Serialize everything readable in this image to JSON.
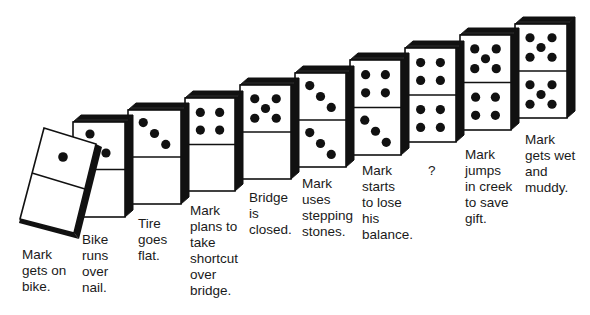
{
  "diagram": {
    "type": "domino-chain",
    "ink_color": "#111111",
    "face_color": "#ffffff",
    "dominoes": [
      {
        "index": 1,
        "top_pips": 1,
        "bottom_pips": 0,
        "fallen": true,
        "label": "Mark\ngets on\nbike.",
        "label_x": 22,
        "label_y": 247
      },
      {
        "index": 2,
        "top_pips": 2,
        "bottom_pips": 0,
        "x": 73,
        "y": 122,
        "w": 52,
        "h": 95,
        "label": "Bike\nruns\nover\nnail.",
        "label_x": 82,
        "label_y": 232
      },
      {
        "index": 3,
        "top_pips": 3,
        "bottom_pips": 0,
        "x": 128,
        "y": 110,
        "w": 53,
        "h": 94,
        "label": "Tire\ngoes\nflat.",
        "label_x": 138,
        "label_y": 216
      },
      {
        "index": 4,
        "top_pips": 4,
        "bottom_pips": 0,
        "x": 185,
        "y": 98,
        "w": 50,
        "h": 93,
        "label": "Mark\nplans to\ntake\nshortcut\nover\nbridge.",
        "label_x": 190,
        "label_y": 203
      },
      {
        "index": 5,
        "top_pips": 5,
        "bottom_pips": 0,
        "x": 240,
        "y": 85,
        "w": 51,
        "h": 94,
        "label": "Bridge\nis\nclosed.",
        "label_x": 249,
        "label_y": 190
      },
      {
        "index": 6,
        "top_pips": 3,
        "bottom_pips": 3,
        "x": 295,
        "y": 73,
        "w": 51,
        "h": 94,
        "label": "Mark\nuses\nstepping\nstones.",
        "label_x": 302,
        "label_y": 176
      },
      {
        "index": 7,
        "top_pips": 4,
        "bottom_pips": 3,
        "x": 350,
        "y": 60,
        "w": 51,
        "h": 95,
        "label": "Mark\nstarts\nto lose\nhis\nbalance.",
        "label_x": 362,
        "label_y": 163
      },
      {
        "index": 8,
        "top_pips": 4,
        "bottom_pips": 4,
        "x": 405,
        "y": 48,
        "w": 51,
        "h": 94,
        "label": "?",
        "label_x": 428,
        "label_y": 163
      },
      {
        "index": 9,
        "top_pips": 5,
        "bottom_pips": 4,
        "x": 460,
        "y": 35,
        "w": 51,
        "h": 95,
        "label": "Mark\njumps\nin creek\nto save\ngift.",
        "label_x": 465,
        "label_y": 147
      },
      {
        "index": 10,
        "top_pips": 5,
        "bottom_pips": 5,
        "x": 515,
        "y": 24,
        "w": 52,
        "h": 94,
        "label": "Mark\ngets wet\nand\nmuddy.",
        "label_x": 525,
        "label_y": 132
      }
    ]
  }
}
